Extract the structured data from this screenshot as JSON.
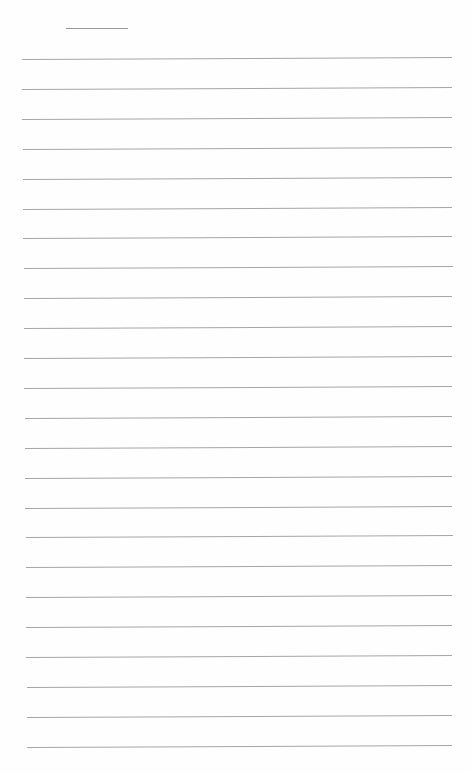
{
  "page": {
    "type": "lined-paper",
    "background": "#ffffff",
    "line_color": "#a6a6a6",
    "header_line": {
      "x1": 66,
      "x2": 128,
      "y": 28
    },
    "rules": {
      "count": 24,
      "first_y": 59,
      "spacing": 29.9,
      "x_start_top": 22,
      "x_start_bottom": 27,
      "x_end": 452,
      "rise_px": 2
    }
  }
}
